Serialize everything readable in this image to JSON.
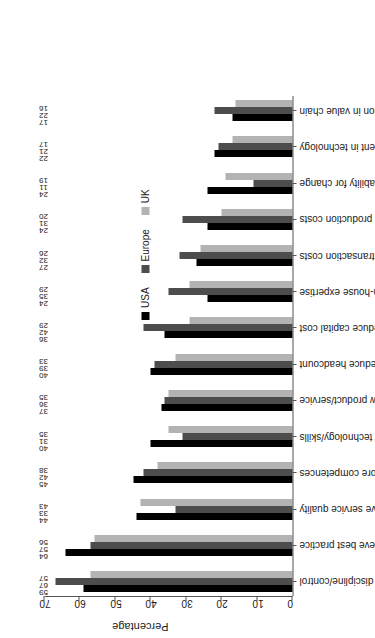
{
  "chart_data": {
    "type": "bar",
    "title": "",
    "subtitle": "",
    "xlabel": "",
    "ylabel": "Percentage",
    "ylim": [
      0,
      70
    ],
    "yticks": [
      0,
      10,
      20,
      30,
      40,
      50,
      60,
      70
    ],
    "grid": false,
    "legend_position": "top-center",
    "orientation": "vertical-bars-rotated-page",
    "categories": [
      "Cost discipline/control",
      "Aim to achieve best practice",
      "Improve service quality",
      "Focus on core competences",
      "Access to new technology/skills",
      "Enhance capability to develop new product/service",
      "Reduce headcount",
      "Reduce capital cost",
      "Grow in-house expertise",
      "Reduce transaction costs",
      "Reduce production costs",
      "Enhance capability for change",
      "Investment in technology",
      "Enhance position in value chain"
    ],
    "series": [
      {
        "name": "USA",
        "color": "#000000",
        "values": [
          59,
          64,
          44,
          45,
          40,
          37,
          40,
          36,
          24,
          27,
          24,
          24,
          22,
          17
        ]
      },
      {
        "name": "Europe",
        "color": "#4d4d4d",
        "values": [
          67,
          57,
          33,
          42,
          31,
          36,
          39,
          42,
          35,
          32,
          31,
          11,
          21,
          22
        ]
      },
      {
        "name": "UK",
        "color": "#b3b3b3",
        "values": [
          57,
          56,
          43,
          38,
          35,
          35,
          33,
          29,
          29,
          26,
          20,
          19,
          17,
          16
        ]
      }
    ]
  },
  "axis": {
    "y_title": "Percentage"
  }
}
